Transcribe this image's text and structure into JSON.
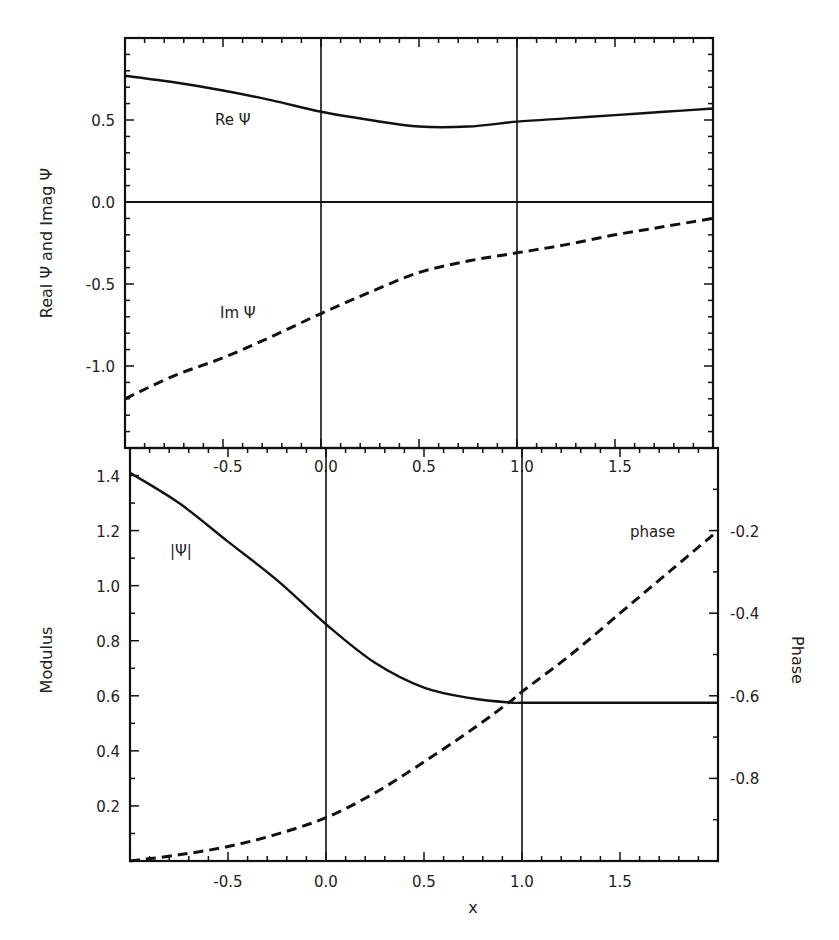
{
  "chart_data": [
    {
      "type": "line",
      "panel": "top",
      "title": "",
      "xlabel": "",
      "ylabel": "Real Ψ and Imag Ψ",
      "xlim": [
        -1.0,
        2.0
      ],
      "ylim": [
        -1.5,
        1.0
      ],
      "x_ticks": [
        -0.5,
        0.0,
        0.5,
        1.0,
        1.5
      ],
      "y_ticks": [
        0.5,
        0.0,
        -0.5,
        -1.0
      ],
      "y_tick_labels": [
        "0.5",
        "0.0",
        "-0.5",
        "-1.0"
      ],
      "grid": false,
      "reference_lines": {
        "vertical_x": [
          0.0,
          1.0
        ],
        "horizontal_y": [
          0.0
        ]
      },
      "x": [
        -1.0,
        -0.75,
        -0.5,
        -0.25,
        0.0,
        0.25,
        0.5,
        0.75,
        1.0,
        1.25,
        1.5,
        1.75,
        2.0
      ],
      "series": [
        {
          "name": "Re Ψ",
          "style": "solid",
          "values": [
            0.77,
            0.73,
            0.68,
            0.62,
            0.55,
            0.5,
            0.46,
            0.46,
            0.49,
            0.51,
            0.53,
            0.55,
            0.57
          ]
        },
        {
          "name": "Im Ψ",
          "style": "dashed",
          "values": [
            -1.2,
            -1.06,
            -0.95,
            -0.82,
            -0.68,
            -0.55,
            -0.43,
            -0.36,
            -0.31,
            -0.26,
            -0.2,
            -0.15,
            -0.1
          ]
        }
      ],
      "annotations": [
        {
          "text": "Re Ψ",
          "x": -0.45,
          "y": 0.48
        },
        {
          "text": "Im Ψ",
          "x": -0.42,
          "y": -0.7
        }
      ]
    },
    {
      "type": "line",
      "panel": "bottom",
      "title": "",
      "xlabel": "x",
      "ylabel": "Modulus",
      "ylabel_right": "Phase",
      "xlim": [
        -1.0,
        2.0
      ],
      "ylim": [
        0.0,
        1.5
      ],
      "ylim_right": [
        -1.0,
        0.0
      ],
      "x_ticks": [
        -0.5,
        0.0,
        0.5,
        1.0,
        1.5
      ],
      "x_tick_labels": [
        "-0.5",
        "0.0",
        "0.5",
        "1.0",
        "1.5"
      ],
      "x_tick_labels_top": [
        "-0.5",
        "0.0",
        "0.5",
        "1.0",
        "1.5"
      ],
      "y_ticks": [
        0.2,
        0.4,
        0.6,
        0.8,
        1.0,
        1.2,
        1.4
      ],
      "y_tick_labels": [
        "0.2",
        "0.4",
        "0.6",
        "0.8",
        "1.0",
        "1.2",
        "1.4"
      ],
      "y_ticks_right": [
        -0.2,
        -0.4,
        -0.6,
        -0.8
      ],
      "y_tick_labels_right": [
        "-0.2",
        "-0.4",
        "-0.6",
        "-0.8"
      ],
      "grid": false,
      "reference_lines": {
        "vertical_x": [
          0.0,
          1.0
        ]
      },
      "x": [
        -1.0,
        -0.75,
        -0.5,
        -0.25,
        0.0,
        0.25,
        0.5,
        0.75,
        0.95,
        1.0,
        1.25,
        1.5,
        1.75,
        2.0
      ],
      "series": [
        {
          "name": "|Ψ|",
          "style": "solid",
          "axis": "left",
          "values": [
            1.41,
            1.3,
            1.16,
            1.02,
            0.86,
            0.72,
            0.63,
            0.59,
            0.575,
            0.575,
            0.575,
            0.575,
            0.575,
            0.575
          ]
        },
        {
          "name": "phase",
          "style": "dashed",
          "axis": "right",
          "values": [
            -1.0,
            -0.985,
            -0.965,
            -0.935,
            -0.895,
            -0.835,
            -0.76,
            -0.68,
            -0.61,
            -0.59,
            -0.5,
            -0.4,
            -0.3,
            -0.2
          ]
        }
      ],
      "annotations": [
        {
          "text": "|Ψ|",
          "x": -0.78,
          "y": 1.17
        },
        {
          "text": "phase",
          "x": 1.65,
          "y": 1.2
        }
      ]
    }
  ],
  "labels": {
    "top_ylabel": "Real Ψ and Imag Ψ",
    "re_label": "Re Ψ",
    "im_label": "Im Ψ",
    "mod_ylabel": "Modulus",
    "phase_ylabel": "Phase",
    "mod_label": "|Ψ|",
    "phase_label": "phase",
    "xlabel": "x"
  }
}
